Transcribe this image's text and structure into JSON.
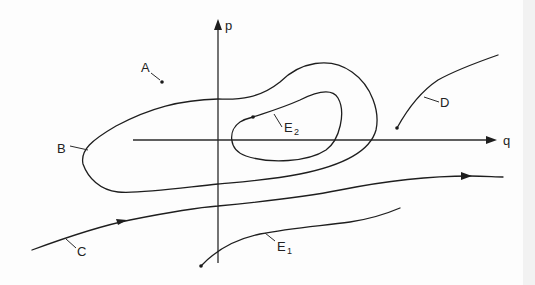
{
  "diagram": {
    "type": "phase-portrait",
    "axes": {
      "vertical_label": "p",
      "horizontal_label": "q"
    },
    "labels": {
      "A": "A",
      "B": "B",
      "C": "C",
      "D": "D",
      "E1_main": "E",
      "E1_sub": "1",
      "E2_main": "E",
      "E2_sub": "2"
    },
    "elements": [
      {
        "id": "A",
        "kind": "point",
        "description": "isolated point"
      },
      {
        "id": "B",
        "kind": "closed-curve",
        "description": "outer closed orbit"
      },
      {
        "id": "E2",
        "kind": "curve",
        "description": "inner curve starting at a point, looping around"
      },
      {
        "id": "D",
        "kind": "curve",
        "description": "curve from a point rising to the right"
      },
      {
        "id": "C",
        "kind": "curve",
        "description": "open trajectory with direction arrows to the right"
      },
      {
        "id": "E1",
        "kind": "curve",
        "description": "curve from a point rising to the right"
      }
    ],
    "colors": {
      "ink": "#1e1e1e",
      "paper": "#fdfdfd"
    }
  }
}
